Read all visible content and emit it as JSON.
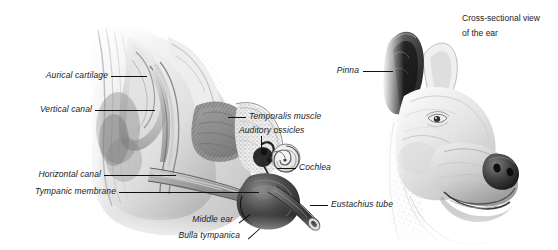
{
  "figure": {
    "background_color": "#ffffff",
    "label_color": "#1a1a1a",
    "leader_color": "#111111",
    "width": 558,
    "height": 250
  },
  "caption": {
    "line1": "Cross-sectional view",
    "line2": "of the ear"
  },
  "left_panel": {
    "name": "ear-cross-section-illustration",
    "labels": [
      {
        "id": "aurical-cartilage",
        "text": "Aurical cartilage"
      },
      {
        "id": "vertical-canal",
        "text": "Vertical canal"
      },
      {
        "id": "horizontal-canal",
        "text": "Horizontal canal"
      },
      {
        "id": "tympanic-membrane",
        "text": "Tympanic membrane"
      },
      {
        "id": "temporalis-muscle",
        "text": "Temporalis muscle"
      },
      {
        "id": "auditory-ossicles",
        "text": "Auditory ossicles"
      },
      {
        "id": "cochlea",
        "text": "Cochlea"
      },
      {
        "id": "eustachius-tube",
        "text": "Eustachius tube"
      },
      {
        "id": "middle-ear",
        "text": "Middle ear"
      },
      {
        "id": "bulla-tympanica",
        "text": "Bulla tympanica"
      }
    ]
  },
  "right_panel": {
    "name": "dog-head-illustration",
    "labels": [
      {
        "id": "pinna",
        "text": "Pinna"
      }
    ]
  }
}
